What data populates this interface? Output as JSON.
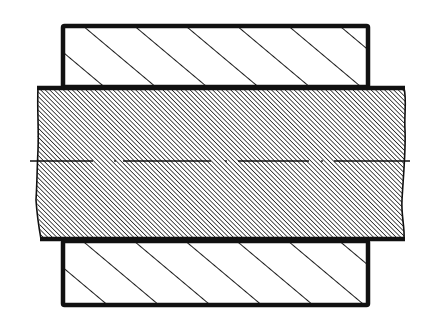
{
  "diagram": {
    "type": "engineering-section-view",
    "colors": {
      "background": "#ffffff",
      "outline": "#111111",
      "hatch": "#1a1a1a",
      "shaft_fill": "#9a9a9a"
    },
    "parts": [
      {
        "id": "hub-top",
        "label": "Hub (upper section)",
        "hatch": "coarse-45deg",
        "x": 62,
        "y": 25,
        "w": 307,
        "h": 62
      },
      {
        "id": "shaft",
        "label": "Shaft",
        "hatch": "fine-45deg",
        "x": 37,
        "y": 87,
        "w": 368,
        "h": 153
      },
      {
        "id": "hub-bottom",
        "label": "Hub (lower section)",
        "hatch": "coarse-45deg",
        "x": 62,
        "y": 240,
        "w": 307,
        "h": 65
      }
    ],
    "centerline": {
      "y": 161,
      "x_start": 30,
      "x_end": 410,
      "style": "dash-dot"
    }
  }
}
